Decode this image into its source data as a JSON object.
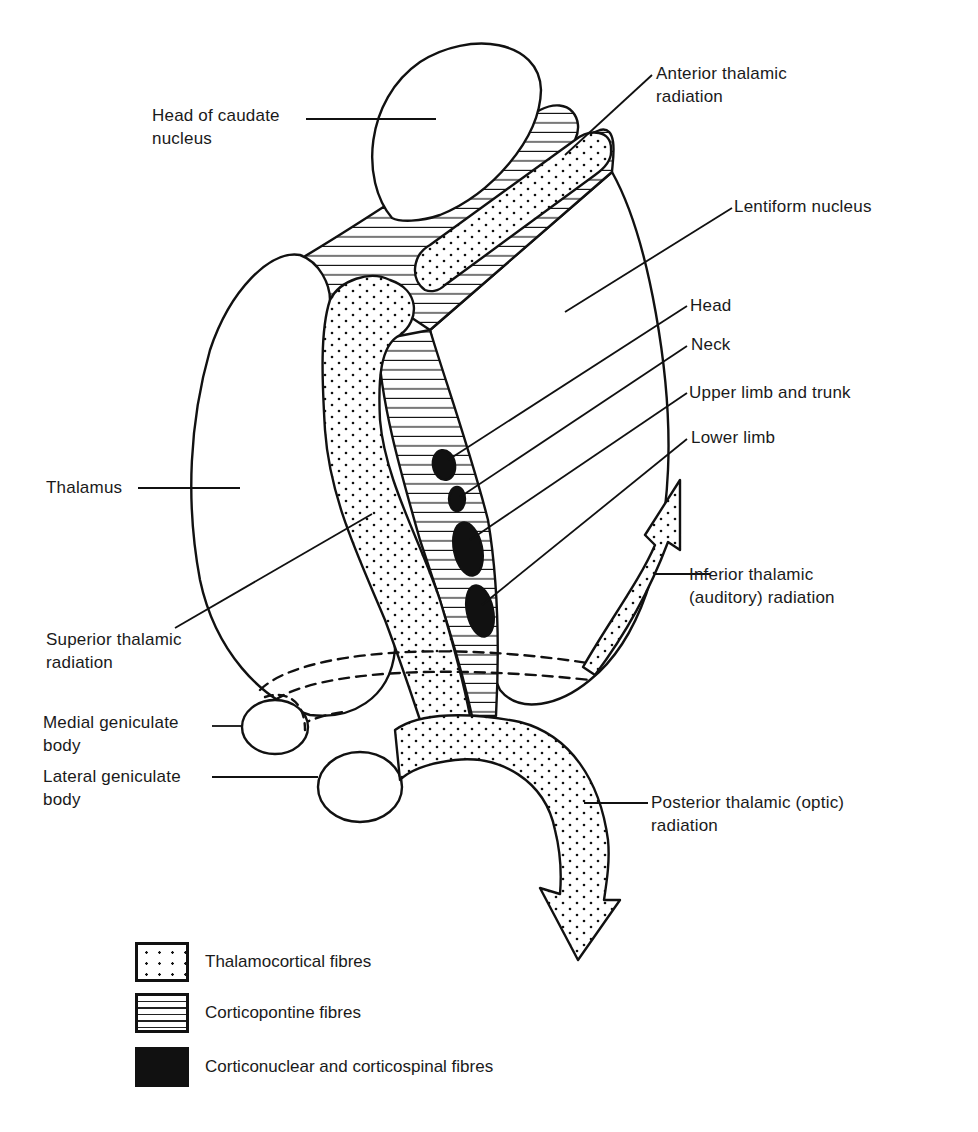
{
  "figure": {
    "colors": {
      "ink": "#111111",
      "background": "#ffffff"
    }
  },
  "labels": {
    "head_of_caudate": "Head of caudate\nnucleus",
    "anterior_thalamic": "Anterior thalamic\nradiation",
    "lentiform": "Lentiform nucleus",
    "head": "Head",
    "neck": "Neck",
    "upper_limb": "Upper limb and trunk",
    "lower_limb": "Lower limb",
    "thalamus": "Thalamus",
    "inferior_thalamic": "Inferior thalamic\n(auditory) radiation",
    "superior_thalamic": "Superior thalamic\nradiation",
    "medial_geniculate": "Medial geniculate\nbody",
    "lateral_geniculate": "Lateral geniculate\nbody",
    "posterior_thalamic": "Posterior thalamic (optic)\nradiation"
  },
  "legend": {
    "items": [
      {
        "pattern": "dots",
        "label": "Thalamocortical fibres"
      },
      {
        "pattern": "horizontal-lines",
        "label": "Corticopontine fibres"
      },
      {
        "pattern": "solid",
        "label": "Corticonuclear and corticospinal fibres"
      }
    ]
  }
}
